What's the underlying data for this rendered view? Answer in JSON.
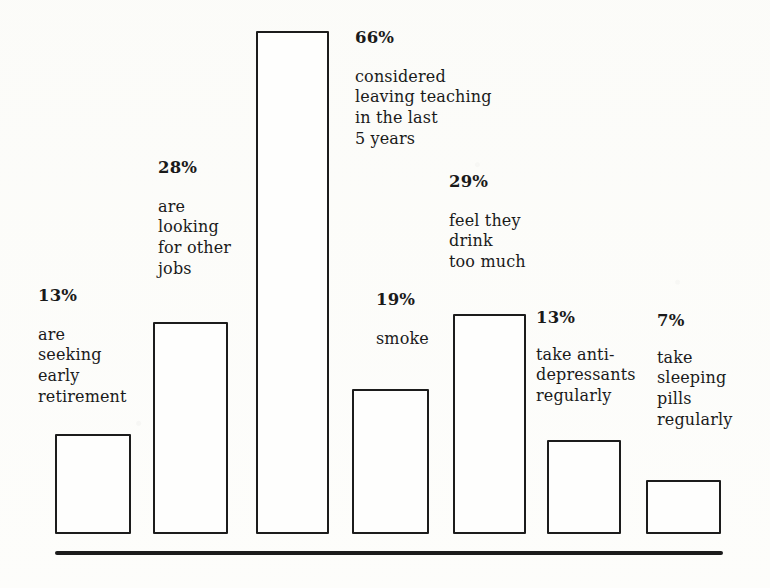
{
  "chart_data": {
    "type": "bar",
    "title": "",
    "subtitle": "",
    "xlabel": "",
    "ylabel": "",
    "grid": false,
    "legend": "none",
    "axis": {
      "baseline_visible": true,
      "y_axis_visible": false,
      "ylim": [
        0,
        66
      ]
    },
    "units": "percent",
    "categories": [
      "are seeking early retirement",
      "are looking for other jobs",
      "considered leaving teaching in the last 5 years",
      "smoke",
      "feel they drink too much",
      "take anti-depressants regularly",
      "take sleeping pills regularly"
    ],
    "values": [
      13,
      28,
      66,
      19,
      29,
      13,
      7
    ],
    "value_labels": [
      "13%",
      "28%",
      "66%",
      "19%",
      "29%",
      "13%",
      "7%"
    ]
  },
  "bars": [
    {
      "id": "bar-early-retirement",
      "pct": "13%",
      "value": 13,
      "desc": "are\nseeking\nearly\nretirement",
      "x": 55,
      "width": 76,
      "top": 434,
      "bottom": 534,
      "label_x": 38,
      "label_y": 288
    },
    {
      "id": "bar-other-jobs",
      "pct": "28%",
      "value": 28,
      "desc": "are\nlooking\nfor other\njobs",
      "x": 153,
      "width": 75,
      "top": 322,
      "bottom": 534,
      "label_x": 158,
      "label_y": 160
    },
    {
      "id": "bar-leaving-teaching",
      "pct": "66%",
      "value": 66,
      "desc": "considered\nleaving teaching\nin the last\n5 years",
      "x": 256,
      "width": 73,
      "top": 31,
      "bottom": 534,
      "label_x": 355,
      "label_y": 30
    },
    {
      "id": "bar-smoke",
      "pct": "19%",
      "value": 19,
      "desc": "smoke",
      "x": 352,
      "width": 77,
      "top": 389,
      "bottom": 534,
      "label_x": 376,
      "label_y": 292
    },
    {
      "id": "bar-drink-too-much",
      "pct": "29%",
      "value": 29,
      "desc": "feel they\ndrink\ntoo much",
      "x": 453,
      "width": 73,
      "top": 314,
      "bottom": 534,
      "label_x": 449,
      "label_y": 174
    },
    {
      "id": "bar-anti-depressants",
      "pct": "13%",
      "value": 13,
      "desc": "take anti-\ndepressants\nregularly",
      "x": 547,
      "width": 74,
      "top": 440,
      "bottom": 534,
      "label_x": 536,
      "label_y": 310
    },
    {
      "id": "bar-sleeping-pills",
      "pct": "7%",
      "value": 7,
      "desc": "take\nsleeping\npills\nregularly",
      "x": 646,
      "width": 75,
      "top": 480,
      "bottom": 534,
      "label_x": 657,
      "label_y": 313
    }
  ],
  "baseline": {
    "x": 55,
    "y": 551,
    "width": 668,
    "thickness": 4
  },
  "colors": {
    "ink": "#1c1c1c",
    "paper": "#fdfdfb",
    "bar_fill": "#fefefd"
  }
}
